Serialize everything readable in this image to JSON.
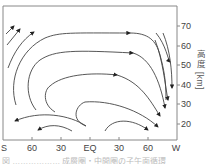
{
  "figure": {
    "x_axis": {
      "ticks": [
        {
          "label": "S",
          "x": 4
        },
        {
          "label": "60",
          "x": 32
        },
        {
          "label": "30",
          "x": 61
        },
        {
          "label": "EQ",
          "x": 90
        },
        {
          "label": "30",
          "x": 119
        },
        {
          "label": "60",
          "x": 148
        },
        {
          "label": "W",
          "x": 176
        }
      ]
    },
    "y_axis": {
      "label": "高度 [km]",
      "ticks": [
        {
          "label": "70",
          "y": 26
        },
        {
          "label": "60",
          "y": 46
        },
        {
          "label": "50",
          "y": 65
        },
        {
          "label": "40",
          "y": 85
        },
        {
          "label": "30",
          "y": 104
        },
        {
          "label": "20",
          "y": 124
        }
      ]
    },
    "caption": "図 ……………… 成層圏・中間圏の子午面循環",
    "colors": {
      "line": "#444444",
      "frame": "#888888",
      "arrow": "#222222"
    }
  }
}
